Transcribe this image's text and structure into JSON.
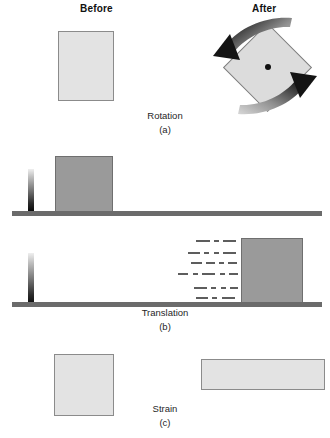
{
  "figure": {
    "width": 330,
    "height": 438,
    "background": "#ffffff"
  },
  "headers": {
    "before": "Before",
    "after": "After"
  },
  "colors": {
    "block_light_fill": "#e3e3e3",
    "block_light_stroke": "#8b8b8b",
    "block_dark_fill": "#9a9a9a",
    "block_dark_stroke": "#6f6f6f",
    "diamond_fill": "#dcdcdc",
    "diamond_stroke": "#7d7d7d",
    "ground_line": "#6b6b6b",
    "dash_line": "#5d5d5d",
    "arrow_dark": "#111111",
    "arrow_light": "#cfcfcf",
    "center_dot": "#111111",
    "text": "#1a1a1a"
  },
  "panels": [
    {
      "id": "a",
      "name": "rotation",
      "caption": "Rotation",
      "sub_caption": "(a)",
      "before_shape": "square",
      "after_shape": "square-rotated-45",
      "arrows": 2,
      "has_center_dot": true
    },
    {
      "id": "b",
      "name": "translation",
      "caption": "Translation",
      "sub_caption": "(b)",
      "before_shape": "square-on-ground-at-left",
      "after_shape": "square-on-ground-at-right",
      "motion_lines": 6,
      "has_reference_post": true
    },
    {
      "id": "c",
      "name": "strain",
      "caption": "Strain",
      "sub_caption": "(c)",
      "before_shape": "square",
      "after_shape": "wide-flat-rectangle"
    }
  ],
  "motion_dash_rows": [
    {
      "y": 240,
      "dashes": [
        [
          196,
          14
        ],
        [
          214,
          5
        ],
        [
          223,
          13
        ]
      ]
    },
    {
      "y": 252,
      "dashes": [
        [
          188,
          12
        ],
        [
          204,
          5
        ],
        [
          214,
          5
        ],
        [
          223,
          13
        ]
      ]
    },
    {
      "y": 262,
      "dashes": [
        [
          191,
          11
        ],
        [
          206,
          9
        ],
        [
          219,
          5
        ],
        [
          228,
          9
        ]
      ]
    },
    {
      "y": 273,
      "dashes": [
        [
          178,
          10
        ],
        [
          193,
          5
        ],
        [
          202,
          13
        ],
        [
          220,
          5
        ],
        [
          229,
          9
        ]
      ]
    },
    {
      "y": 287,
      "dashes": [
        [
          194,
          13
        ],
        [
          211,
          5
        ],
        [
          221,
          5
        ],
        [
          230,
          8
        ]
      ]
    },
    {
      "y": 297,
      "dashes": [
        [
          196,
          12
        ],
        [
          212,
          5
        ],
        [
          222,
          13
        ]
      ]
    }
  ],
  "shapes": {
    "rotation_before_square": {
      "x": 58,
      "y": 31,
      "w": 56,
      "h": 70
    },
    "rotation_after_diamond": {
      "cx": 268,
      "cy": 67,
      "size": 63
    },
    "rotation_center_dot": {
      "cx": 268,
      "cy": 67,
      "r": 3
    },
    "translation_before_square": {
      "x": 55,
      "y": 156,
      "w": 58,
      "h": 57
    },
    "translation_after_square": {
      "x": 241,
      "y": 238,
      "w": 62,
      "h": 68
    },
    "translation_post_upper": {
      "x": 28,
      "y": 169,
      "w": 6,
      "h": 44
    },
    "translation_post_lower": {
      "x": 28,
      "y": 253,
      "w": 6,
      "h": 54
    },
    "ground_upper": {
      "x": 12,
      "y": 211,
      "w": 310,
      "h": 5
    },
    "ground_lower": {
      "x": 12,
      "y": 302,
      "w": 310,
      "h": 5
    },
    "strain_before_square": {
      "x": 54,
      "y": 354,
      "w": 60,
      "h": 62
    },
    "strain_after_rect": {
      "x": 201,
      "y": 359,
      "w": 124,
      "h": 31
    }
  },
  "labels": {
    "before_x": 98,
    "before_y": 4,
    "after_x": 270,
    "after_y": 4
  }
}
